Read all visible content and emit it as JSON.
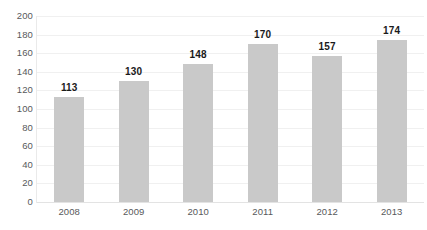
{
  "chart_data": {
    "type": "bar",
    "title": "",
    "subtitle": "",
    "xlabel": "",
    "ylabel": "",
    "categories": [
      "2008",
      "2009",
      "2010",
      "2011",
      "2012",
      "2013"
    ],
    "values": [
      113,
      130,
      148,
      170,
      157,
      174
    ],
    "data_labels": [
      "113",
      "130",
      "148",
      "170",
      "157",
      "174"
    ],
    "ylim": [
      0,
      200
    ],
    "ytick_step": 20,
    "ytick_labels": [
      "200",
      "180",
      "160",
      "140",
      "120",
      "100",
      "80",
      "60",
      "40",
      "20",
      "0"
    ],
    "ytick_values": [
      200,
      180,
      160,
      140,
      120,
      100,
      80,
      60,
      40,
      20,
      0
    ],
    "grid": true,
    "legend": false,
    "legend_position": "none",
    "series": [
      {
        "name": "",
        "values": [
          113,
          130,
          148,
          170,
          157,
          174
        ]
      }
    ],
    "colors": {
      "bar_fill": "#c9c9c9",
      "gridline": "#f0f0f0",
      "baseline": "#e3e3e3",
      "axis_line": "#eaeaea",
      "tick_label": "#58595b",
      "value_label": "#1a1a1a",
      "background": "#ffffff"
    }
  }
}
